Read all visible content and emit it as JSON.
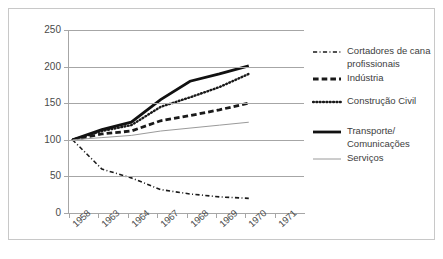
{
  "chart_data": {
    "type": "line",
    "title": "",
    "subtitle": "",
    "xlabel": "",
    "ylabel": "",
    "categories": [
      "1958",
      "1963",
      "1964",
      "1967",
      "1968",
      "1969",
      "1970",
      "1971"
    ],
    "ylim": [
      0,
      250
    ],
    "yticks": [
      0,
      50,
      100,
      150,
      200,
      250
    ],
    "grid": true,
    "legend_position": "right",
    "series": [
      {
        "name": "Cortadores de cana profissionais",
        "style": "dash-dot",
        "color": "#1a1a1a",
        "width": 1.6,
        "x": [
          "1958",
          "1963",
          "1964",
          "1967",
          "1968",
          "1969",
          "1970"
        ],
        "values": [
          100,
          60,
          48,
          32,
          26,
          22,
          20
        ]
      },
      {
        "name": "Indústria",
        "style": "dashed",
        "color": "#1a1a1a",
        "width": 2.8,
        "x": [
          "1958",
          "1963",
          "1964",
          "1967",
          "1968",
          "1969",
          "1970"
        ],
        "values": [
          100,
          108,
          112,
          126,
          133,
          141,
          150
        ]
      },
      {
        "name": "Construção Civil",
        "style": "dotted",
        "color": "#1a1a1a",
        "width": 2.4,
        "x": [
          "1958",
          "1963",
          "1964",
          "1967",
          "1968",
          "1969",
          "1970"
        ],
        "values": [
          100,
          112,
          120,
          145,
          158,
          172,
          190
        ]
      },
      {
        "name": "Transporte/ Comunicações",
        "style": "solid",
        "color": "#111111",
        "width": 2.8,
        "x": [
          "1958",
          "1963",
          "1964",
          "1967",
          "1968",
          "1969",
          "1970"
        ],
        "values": [
          100,
          114,
          124,
          155,
          180,
          190,
          201
        ]
      },
      {
        "name": "Serviços",
        "style": "solid-thin",
        "color": "#9a9a9a",
        "width": 1,
        "x": [
          "1958",
          "1963",
          "1964",
          "1967",
          "1968",
          "1969",
          "1970"
        ],
        "values": [
          100,
          103,
          106,
          112,
          116,
          120,
          124
        ]
      }
    ]
  },
  "legend": {
    "items": [
      {
        "label_lines": [
          "Cortadores de cana",
          "profissionais"
        ],
        "style": "dash-dot"
      },
      {
        "label_lines": [
          "Indústria"
        ],
        "style": "dashed"
      },
      {
        "label_lines": [
          "Construção Civil"
        ],
        "style": "dotted"
      },
      {
        "label_lines": [
          "Transporte/",
          "Comunicações"
        ],
        "style": "solid"
      },
      {
        "label_lines": [
          "Serviços"
        ],
        "style": "solid-thin"
      }
    ]
  }
}
